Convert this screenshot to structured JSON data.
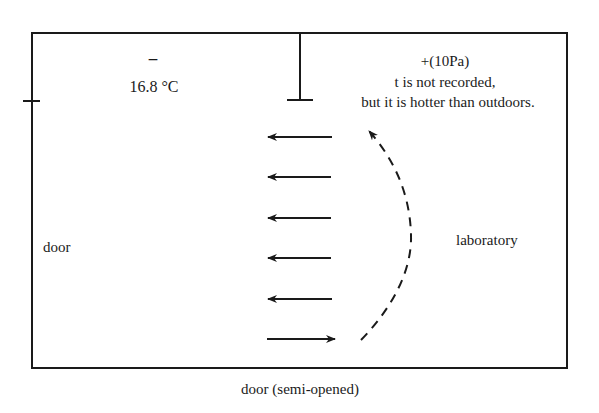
{
  "diagram": {
    "colors": {
      "line": "#1a1a1a",
      "background": "#ffffff"
    },
    "left_room": {
      "pressure_sign": "–",
      "temperature": "16.8 °C"
    },
    "right_room": {
      "pressure": "+(10Pa)",
      "note_line1": "t is not recorded,",
      "note_line2": "but it is hotter than outdoors.",
      "name": "laboratory"
    },
    "left_wall_label": "door",
    "bottom_wall_label": "door (semi-opened)",
    "airflow": {
      "straight_arrows": [
        {
          "y": 137,
          "direction": "left"
        },
        {
          "y": 177,
          "direction": "left"
        },
        {
          "y": 218,
          "direction": "left"
        },
        {
          "y": 258,
          "direction": "left"
        },
        {
          "y": 299,
          "direction": "left"
        },
        {
          "y": 339,
          "direction": "right"
        }
      ],
      "curved_arrow": {
        "style": "dashed",
        "direction": "upward"
      }
    }
  }
}
